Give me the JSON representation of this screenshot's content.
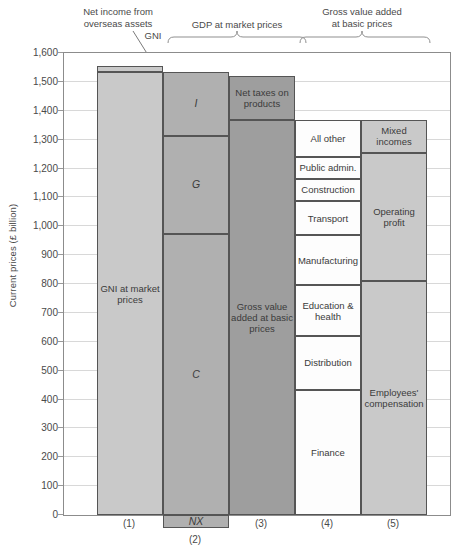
{
  "chart_data": {
    "type": "bar",
    "title": "",
    "subtitle": "",
    "xlabel": "",
    "ylabel": "Current prices (£ billion)",
    "ylim": [
      -100,
      1600
    ],
    "yticks": [
      "1,600",
      "1,500",
      "1,400",
      "1,300",
      "1,200",
      "1,100",
      "1,000",
      "900",
      "800",
      "700",
      "600",
      "500",
      "400",
      "300",
      "200",
      "100",
      "0"
    ],
    "ytick_values": [
      1600,
      1500,
      1400,
      1300,
      1200,
      1100,
      1000,
      900,
      800,
      700,
      600,
      500,
      400,
      300,
      200,
      100,
      0
    ],
    "grid": true,
    "legend_position": "none",
    "categories": [
      "(1)",
      "(2)",
      "(3)",
      "(4)",
      "(5)"
    ],
    "annotations": [
      {
        "text": "Net income from overseas assets",
        "target": "column-1-top-sliver"
      },
      {
        "text": "GNI",
        "target": "column-1"
      },
      {
        "text": "GDP at market prices",
        "target": "columns-2-3"
      },
      {
        "text": "Gross value added at basic prices",
        "target": "columns-3-5"
      }
    ],
    "columns": [
      {
        "id": "1",
        "axis_label": "(1)",
        "total": 1555,
        "segments": [
          {
            "label": "Net income from overseas assets",
            "value": 21,
            "from": 1534,
            "to": 1555,
            "shade": "light",
            "label_shown": false
          },
          {
            "label": "GNI at market prices",
            "value": 1534,
            "from": 0,
            "to": 1534,
            "shade": "light",
            "label_shown": true
          }
        ]
      },
      {
        "id": "2",
        "axis_label": "(2)",
        "total": 1534,
        "segments": [
          {
            "label": "I",
            "value": 220,
            "from": 1314,
            "to": 1534,
            "shade": "mid",
            "label_shown": true,
            "italic": true
          },
          {
            "label": "G",
            "value": 342,
            "from": 972,
            "to": 1314,
            "shade": "mid",
            "label_shown": true,
            "italic": true
          },
          {
            "label": "C",
            "value": 972,
            "from": 0,
            "to": 972,
            "shade": "mid",
            "label_shown": true,
            "italic": true
          },
          {
            "label": "NX",
            "value": -45,
            "from": -45,
            "to": 0,
            "shade": "mid",
            "label_shown": true,
            "italic": true
          }
        ]
      },
      {
        "id": "3",
        "axis_label": "(3)",
        "total": 1521,
        "segments": [
          {
            "label": "Net taxes on products",
            "value": 152,
            "from": 1369,
            "to": 1521,
            "shade": "dark",
            "label_shown": true
          },
          {
            "label": "Gross value added at basic prices",
            "value": 1369,
            "from": 0,
            "to": 1369,
            "shade": "dark",
            "label_shown": true
          }
        ]
      },
      {
        "id": "4",
        "axis_label": "(4)",
        "total": 1369,
        "segments": [
          {
            "label": "All other",
            "value": 128,
            "from": 1241,
            "to": 1369,
            "shade": "white",
            "label_shown": true
          },
          {
            "label": "Public admin.",
            "value": 76,
            "from": 1165,
            "to": 1241,
            "shade": "white",
            "label_shown": true
          },
          {
            "label": "Construction",
            "value": 76,
            "from": 1089,
            "to": 1165,
            "shade": "white",
            "label_shown": true
          },
          {
            "label": "Transport",
            "value": 121,
            "from": 968,
            "to": 1089,
            "shade": "white",
            "label_shown": true
          },
          {
            "label": "Manufacturing",
            "value": 172,
            "from": 796,
            "to": 968,
            "shade": "white",
            "label_shown": true
          },
          {
            "label": "Education & health",
            "value": 176,
            "from": 620,
            "to": 796,
            "shade": "white",
            "label_shown": true
          },
          {
            "label": "Distribution",
            "value": 186,
            "from": 434,
            "to": 620,
            "shade": "white",
            "label_shown": true
          },
          {
            "label": "Finance",
            "value": 434,
            "from": 0,
            "to": 434,
            "shade": "white",
            "label_shown": true
          }
        ]
      },
      {
        "id": "5",
        "axis_label": "(5)",
        "total": 1369,
        "segments": [
          {
            "label": "Mixed incomes",
            "value": 114,
            "from": 1255,
            "to": 1369,
            "shade": "light",
            "label_shown": true
          },
          {
            "label": "Operating profit",
            "value": 445,
            "from": 810,
            "to": 1255,
            "shade": "light",
            "label_shown": true
          },
          {
            "label": "Employees' compensation",
            "value": 810,
            "from": 0,
            "to": 810,
            "shade": "light",
            "label_shown": true
          }
        ]
      }
    ]
  },
  "axis": {
    "ylabel": "Current prices (£ billion)"
  },
  "top_annotations": {
    "net_income": "Net income from\noverseas assets",
    "net_income_line1": "Net income from",
    "net_income_line2": "overseas assets",
    "gni": "GNI",
    "gdp_line1": "GDP at market prices",
    "gva_line1": "Gross value added",
    "gva_line2": "at basic prices"
  }
}
